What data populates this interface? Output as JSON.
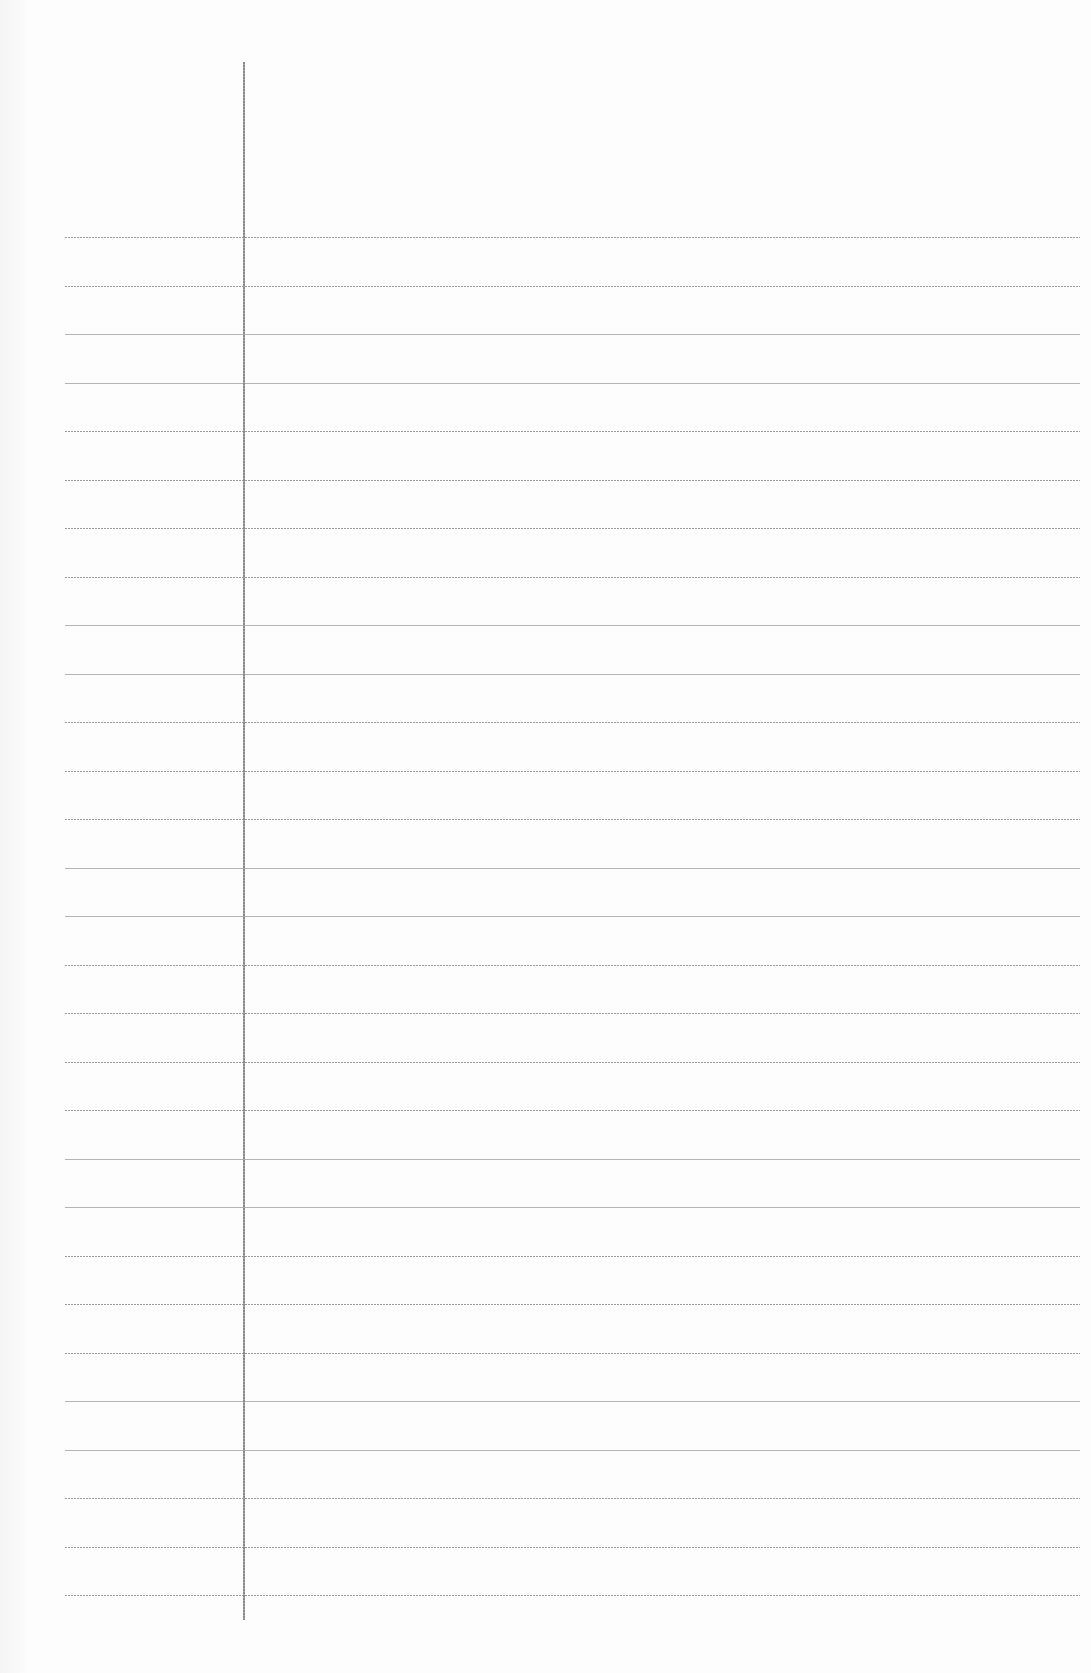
{
  "document": {
    "type": "lined-notebook-page",
    "text_content": [],
    "colors": {
      "paper": "#fdfdfd",
      "rule_line": "#9c9c9c",
      "margin_line": "#8a8a8a"
    }
  },
  "layout": {
    "margin_line": {
      "x": 243,
      "top": 62,
      "bottom": 1620
    },
    "rules": {
      "count": 29,
      "first_y": 237,
      "spacing": 48.5,
      "left": 65,
      "right": 1080
    }
  }
}
